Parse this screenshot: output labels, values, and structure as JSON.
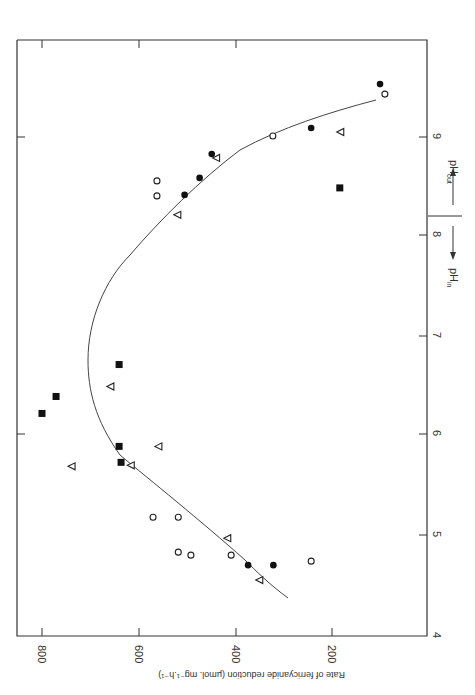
{
  "chart_data": {
    "type": "scatter",
    "orientation": "rotated 90deg clockwise (x-axis pH runs down the right edge, y-axis rate along the bottom)",
    "title": "",
    "xlabel": "pH",
    "xlabel_regions": [
      {
        "label": "pH_in",
        "direction": "toward lower pH",
        "arrow": "down"
      },
      {
        "label": "pH_out",
        "direction": "toward higher pH",
        "arrow": "up"
      }
    ],
    "ylabel": "Rate of ferricyanide reduction (µmol. mg⁻¹.h⁻¹)",
    "xlim": [
      4,
      9.7
    ],
    "ylim": [
      0,
      850
    ],
    "x_ticks": [
      4,
      5,
      6,
      7,
      8,
      9
    ],
    "y_ticks": [
      200,
      400,
      600,
      800
    ],
    "divider_at_x": 8.17,
    "grid": false,
    "legend": null,
    "series": [
      {
        "name": "filled-square",
        "marker": "square-filled",
        "points": [
          {
            "x": 6.23,
            "y": 800
          },
          {
            "x": 6.4,
            "y": 771
          },
          {
            "x": 6.72,
            "y": 641
          },
          {
            "x": 5.9,
            "y": 641
          },
          {
            "x": 5.74,
            "y": 637
          },
          {
            "x": 8.49,
            "y": 186
          }
        ]
      },
      {
        "name": "open-triangle",
        "marker": "triangle-open",
        "points": [
          {
            "x": 5.7,
            "y": 738
          },
          {
            "x": 6.5,
            "y": 658
          },
          {
            "x": 5.71,
            "y": 616
          },
          {
            "x": 5.9,
            "y": 559
          },
          {
            "x": 4.98,
            "y": 417
          },
          {
            "x": 4.56,
            "y": 351
          },
          {
            "x": 9.05,
            "y": 184
          },
          {
            "x": 8.79,
            "y": 440
          },
          {
            "x": 8.22,
            "y": 520
          }
        ]
      },
      {
        "name": "filled-circle",
        "marker": "circle-filled",
        "points": [
          {
            "x": 9.53,
            "y": 103
          },
          {
            "x": 9.09,
            "y": 245
          },
          {
            "x": 8.83,
            "y": 450
          },
          {
            "x": 8.59,
            "y": 475
          },
          {
            "x": 8.42,
            "y": 506
          },
          {
            "x": 4.71,
            "y": 375
          },
          {
            "x": 4.71,
            "y": 323
          }
        ]
      },
      {
        "name": "open-circle",
        "marker": "circle-open",
        "points": [
          {
            "x": 9.43,
            "y": 93
          },
          {
            "x": 9.01,
            "y": 324
          },
          {
            "x": 8.56,
            "y": 563
          },
          {
            "x": 8.41,
            "y": 563
          },
          {
            "x": 5.19,
            "y": 571
          },
          {
            "x": 5.19,
            "y": 519
          },
          {
            "x": 4.84,
            "y": 519
          },
          {
            "x": 4.81,
            "y": 493
          },
          {
            "x": 4.81,
            "y": 410
          },
          {
            "x": 4.75,
            "y": 245
          }
        ]
      }
    ],
    "fit_curve": {
      "description": "smooth parabola-like fitted curve",
      "points": [
        {
          "x": 4.62,
          "y": 290
        },
        {
          "x": 4.75,
          "y": 330
        },
        {
          "x": 5.0,
          "y": 450
        },
        {
          "x": 5.5,
          "y": 590
        },
        {
          "x": 6.0,
          "y": 665
        },
        {
          "x": 6.5,
          "y": 697
        },
        {
          "x": 6.75,
          "y": 702
        },
        {
          "x": 7.0,
          "y": 697
        },
        {
          "x": 7.5,
          "y": 670
        },
        {
          "x": 8.0,
          "y": 610
        },
        {
          "x": 8.5,
          "y": 530
        },
        {
          "x": 8.8,
          "y": 450
        },
        {
          "x": 9.0,
          "y": 345
        },
        {
          "x": 9.2,
          "y": 230
        },
        {
          "x": 9.36,
          "y": 130
        }
      ]
    }
  },
  "labels": {
    "y_ticks": [
      "800",
      "600",
      "400",
      "200"
    ],
    "x_ticks": [
      "4",
      "5",
      "6",
      "7",
      "8",
      "9"
    ],
    "ylabel": "Rate of ferricyanide reduction (µmol. mg⁻¹.h⁻¹)",
    "ph_in": "pH",
    "ph_in_sub": "in",
    "ph_out": "pH",
    "ph_out_sub": "out"
  }
}
